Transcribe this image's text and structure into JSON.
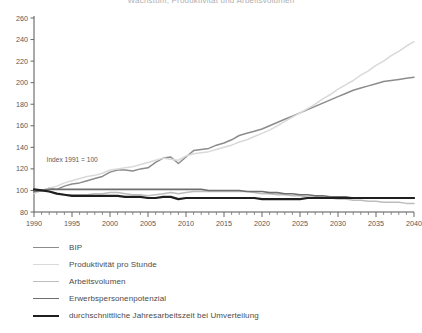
{
  "chart_data": {
    "type": "line",
    "title": "Wachstum, Produktivität und Arbeitsvolumen",
    "xlabel": "",
    "ylabel": "",
    "xlim": [
      1990,
      2040
    ],
    "ylim": [
      80,
      260
    ],
    "ytick_step": 20,
    "xtick_step": 5,
    "xminor_step": 1,
    "grid": false,
    "legend_position": "below",
    "annotation": "Index 1991 = 100",
    "yticks": [
      80,
      100,
      120,
      140,
      160,
      180,
      200,
      220,
      240,
      260
    ],
    "xticks": [
      1990,
      1995,
      2000,
      2005,
      2010,
      2015,
      2020,
      2025,
      2030,
      2035,
      2040
    ],
    "series": [
      {
        "name": "BIP",
        "color": "#8c8c8c",
        "width": 1.5,
        "x": [
          1990,
          1991,
          1992,
          1993,
          1994,
          1995,
          1996,
          1997,
          1998,
          1999,
          2000,
          2001,
          2002,
          2003,
          2004,
          2005,
          2006,
          2007,
          2008,
          2009,
          2010,
          2011,
          2012,
          2013,
          2014,
          2015,
          2016,
          2017,
          2018,
          2019,
          2020,
          2021,
          2022,
          2023,
          2024,
          2025,
          2026,
          2027,
          2028,
          2029,
          2030,
          2031,
          2032,
          2033,
          2034,
          2035,
          2036,
          2037,
          2038,
          2039,
          2040
        ],
        "y": [
          98,
          100,
          102,
          101,
          104,
          106,
          107,
          109,
          111,
          113,
          117,
          119,
          119,
          118,
          120,
          121,
          126,
          130,
          131,
          125,
          131,
          137,
          138,
          139,
          142,
          144,
          147,
          151,
          153,
          155,
          157,
          160,
          163,
          166,
          169,
          172,
          175,
          178,
          181,
          184,
          187,
          190,
          193,
          195,
          197,
          199,
          201,
          202,
          203,
          204,
          205
        ]
      },
      {
        "name": "Produktivität pro Stunde",
        "color": "#d9d9d9",
        "width": 1.5,
        "x": [
          1990,
          1991,
          1992,
          1993,
          1994,
          1995,
          1996,
          1997,
          1998,
          1999,
          2000,
          2001,
          2002,
          2003,
          2004,
          2005,
          2006,
          2007,
          2008,
          2009,
          2010,
          2011,
          2012,
          2013,
          2014,
          2015,
          2016,
          2017,
          2018,
          2019,
          2020,
          2021,
          2022,
          2023,
          2024,
          2025,
          2026,
          2027,
          2028,
          2029,
          2030,
          2031,
          2032,
          2033,
          2034,
          2035,
          2036,
          2037,
          2038,
          2039,
          2040
        ],
        "y": [
          97,
          100,
          102,
          104,
          107,
          109,
          111,
          113,
          114,
          116,
          119,
          120,
          121,
          122,
          124,
          126,
          128,
          130,
          129,
          128,
          132,
          134,
          135,
          136,
          138,
          140,
          142,
          145,
          147,
          150,
          153,
          156,
          160,
          164,
          168,
          172,
          176,
          180,
          185,
          189,
          194,
          198,
          202,
          207,
          211,
          216,
          220,
          225,
          229,
          234,
          238
        ]
      },
      {
        "name": "Arbeitsvolumen",
        "color": "#bdbdbd",
        "width": 1.5,
        "x": [
          1990,
          1991,
          1992,
          1993,
          1994,
          1995,
          1996,
          1997,
          1998,
          1999,
          2000,
          2001,
          2002,
          2003,
          2004,
          2005,
          2006,
          2007,
          2008,
          2009,
          2010,
          2011,
          2012,
          2013,
          2014,
          2015,
          2016,
          2017,
          2018,
          2019,
          2020,
          2021,
          2022,
          2023,
          2024,
          2025,
          2026,
          2027,
          2028,
          2029,
          2030,
          2031,
          2032,
          2033,
          2034,
          2035,
          2036,
          2037,
          2038,
          2039,
          2040
        ],
        "y": [
          101,
          100,
          99,
          97,
          96,
          96,
          96,
          96,
          97,
          97,
          98,
          98,
          97,
          96,
          96,
          95,
          96,
          97,
          98,
          97,
          98,
          99,
          99,
          99,
          99,
          99,
          99,
          99,
          99,
          98,
          97,
          97,
          96,
          96,
          95,
          95,
          94,
          94,
          93,
          93,
          92,
          92,
          91,
          91,
          90,
          90,
          89,
          89,
          89,
          88,
          88
        ]
      },
      {
        "name": "Erwerbspersonenpotenzial",
        "color": "#6e6e6e",
        "width": 1.6,
        "x": [
          1990,
          1991,
          1992,
          1993,
          1994,
          1995,
          1996,
          1997,
          1998,
          1999,
          2000,
          2001,
          2002,
          2003,
          2004,
          2005,
          2006,
          2007,
          2008,
          2009,
          2010,
          2011,
          2012,
          2013,
          2014,
          2015,
          2016,
          2017,
          2018,
          2019,
          2020,
          2021,
          2022,
          2023,
          2024,
          2025,
          2026,
          2027,
          2028,
          2029,
          2030,
          2031,
          2032,
          2033,
          2034,
          2035,
          2036,
          2037,
          2038,
          2039,
          2040
        ],
        "y": [
          99,
          100,
          101,
          101,
          101,
          101,
          101,
          101,
          101,
          101,
          101,
          101,
          101,
          101,
          101,
          101,
          101,
          101,
          101,
          101,
          101,
          101,
          101,
          100,
          100,
          100,
          100,
          100,
          99,
          99,
          99,
          98,
          98,
          97,
          97,
          96,
          96,
          95,
          95,
          94,
          94,
          94,
          93,
          93,
          93,
          93,
          93,
          93,
          93,
          93,
          93
        ]
      },
      {
        "name": "durchschnittliche Jahresarbeitszeit bei Umverteilung",
        "color": "#1f1f1f",
        "width": 2.2,
        "x": [
          1990,
          1991,
          1992,
          1993,
          1994,
          1995,
          1996,
          1997,
          1998,
          1999,
          2000,
          2001,
          2002,
          2003,
          2004,
          2005,
          2006,
          2007,
          2008,
          2009,
          2010,
          2011,
          2012,
          2013,
          2014,
          2015,
          2016,
          2017,
          2018,
          2019,
          2020,
          2021,
          2022,
          2023,
          2024,
          2025,
          2026,
          2027,
          2028,
          2029,
          2030,
          2031,
          2032,
          2033,
          2034,
          2035,
          2036,
          2037,
          2038,
          2039,
          2040
        ],
        "y": [
          101,
          100,
          99,
          97,
          96,
          95,
          95,
          95,
          95,
          95,
          95,
          95,
          94,
          94,
          94,
          93,
          93,
          94,
          94,
          92,
          93,
          93,
          93,
          93,
          93,
          93,
          93,
          93,
          93,
          93,
          92,
          92,
          92,
          92,
          92,
          92,
          93,
          93,
          93,
          93,
          93,
          93,
          93,
          93,
          93,
          93,
          93,
          93,
          93,
          93,
          93
        ]
      }
    ]
  },
  "legend": {
    "items": [
      {
        "label": "BIP",
        "color": "#8c8c8c",
        "width": "1.5px"
      },
      {
        "label": "Produktivität pro Stunde",
        "color": "#d9d9d9",
        "width": "1.5px"
      },
      {
        "label": "Arbeitsvolumen",
        "color": "#bdbdbd",
        "width": "1.5px"
      },
      {
        "label": "Erwerbspersonenpotenzial",
        "color": "#6e6e6e",
        "width": "1.8px"
      },
      {
        "label": "durchschnittliche Jahresarbeitszeit bei Umverteilung",
        "color": "#1f1f1f",
        "width": "2.6px"
      }
    ]
  },
  "axis": {
    "color": "#555555",
    "tick_color": "#666666"
  }
}
